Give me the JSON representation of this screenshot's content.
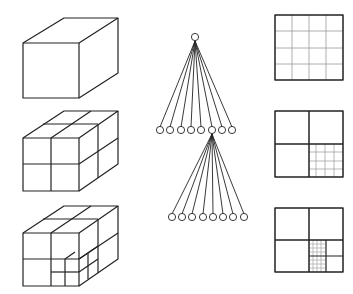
{
  "figure": {
    "colors": {
      "stroke": "#222222",
      "fine_grid": "#888888",
      "background": "#ffffff"
    },
    "columns": [
      {
        "name": "cubes",
        "items": [
          "cube-undivided",
          "cube-octant-split",
          "cube-second-level-split"
        ]
      },
      {
        "name": "trees",
        "items": [
          "tree-level-1",
          "tree-level-2"
        ],
        "children_per_node": 8,
        "expanded_child_index": 6
      },
      {
        "name": "grids",
        "items": [
          "grid-uniform-4x4",
          "grid-quadrant-fine",
          "grid-subquadrant-fine"
        ]
      }
    ]
  }
}
